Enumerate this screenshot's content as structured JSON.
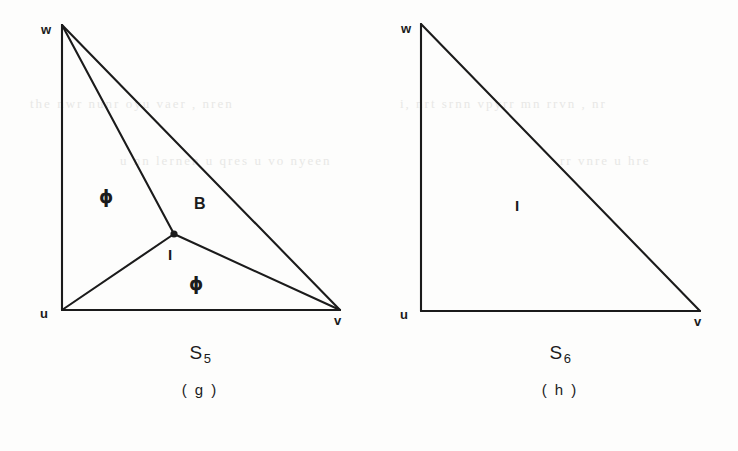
{
  "figure": {
    "background_color": "#fdfdfc",
    "ink_color": "#1b1b1b",
    "width": 738,
    "height": 451
  },
  "panels": [
    {
      "id": "panel-g",
      "name": "S",
      "subscript": "5",
      "index_label": "( g )",
      "vertices": [
        {
          "id": "w",
          "label": "w",
          "x": 62,
          "y": 25
        },
        {
          "id": "u",
          "label": "u",
          "x": 62,
          "y": 310
        },
        {
          "id": "v",
          "label": "v",
          "x": 340,
          "y": 310
        }
      ],
      "steiner_point": {
        "id": "junction",
        "x": 174,
        "y": 234,
        "radius": 3.5
      },
      "edges": [
        {
          "from": "w",
          "to": "u"
        },
        {
          "from": "u",
          "to": "v"
        },
        {
          "from": "w",
          "to": "v"
        },
        {
          "from": "w",
          "to": "junction"
        },
        {
          "from": "u",
          "to": "junction"
        },
        {
          "from": "v",
          "to": "junction"
        }
      ],
      "region_labels": [
        {
          "text": "ϕ",
          "x": 107,
          "y": 198,
          "kind": "phi"
        },
        {
          "text": "B",
          "x": 200,
          "y": 205,
          "kind": "letter"
        },
        {
          "text": "I",
          "x": 171,
          "y": 256,
          "kind": "i"
        },
        {
          "text": "ϕ",
          "x": 197,
          "y": 285,
          "kind": "phi"
        }
      ]
    },
    {
      "id": "panel-h",
      "name": "S",
      "subscript": "6",
      "index_label": "( h )",
      "vertices": [
        {
          "id": "w",
          "label": "w",
          "x": 421,
          "y": 24
        },
        {
          "id": "u",
          "label": "u",
          "x": 421,
          "y": 311
        },
        {
          "id": "v",
          "label": "v",
          "x": 700,
          "y": 311
        }
      ],
      "steiner_point": null,
      "edges": [
        {
          "from": "w",
          "to": "u"
        },
        {
          "from": "u",
          "to": "v"
        },
        {
          "from": "w",
          "to": "v"
        }
      ],
      "region_labels": [
        {
          "text": "I",
          "x": 518,
          "y": 207,
          "kind": "i"
        }
      ]
    }
  ],
  "captions": [
    {
      "id": "caption-g",
      "name": "S",
      "subscript": "5",
      "index": "( g )",
      "center_x": 200,
      "name_y": 356,
      "index_y": 392
    },
    {
      "id": "caption-h",
      "name": "S",
      "subscript": "6",
      "index": "( h )",
      "center_x": 560,
      "name_y": 356,
      "index_y": 392
    }
  ],
  "bleed_text": [
    {
      "text": "the  nwr  nunr  oyu  vaer  ,  nren",
      "x": 30,
      "y": 103,
      "size": 12
    },
    {
      "text": "i,  nrt  srnn  vpyrr  mn  rrvn  ,  nr",
      "x": 400,
      "y": 103,
      "size": 12
    },
    {
      "text": "u  nn  lernen  u  qres  u  vo  nyeen",
      "x": 120,
      "y": 160,
      "size": 11
    },
    {
      "text": "rr  vnre  u  hre",
      "x": 560,
      "y": 160,
      "size": 11
    }
  ]
}
